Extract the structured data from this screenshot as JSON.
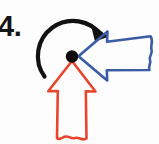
{
  "figure": {
    "problem_label": "4.",
    "canvas": {
      "width": 159,
      "height": 144,
      "background": "#fdfdfd"
    },
    "colors": {
      "label": "#161616",
      "rotation_arc": "#111111",
      "blue_vector": "#3b5ba5",
      "red_vector": "#e8452c",
      "pivot_dot": "#0d0d0d",
      "background": "#fdfdfd"
    },
    "elements": {
      "pivot": {
        "name": "pivot-point",
        "shape": "filled-circle",
        "cx": 72,
        "cy": 56.5,
        "r": 6.2,
        "color": "#0d0d0d"
      },
      "rotation_arc": {
        "name": "counterclockwise-rotation-arc",
        "color": "#111111",
        "stroke_width": 4.2,
        "center_x": 72,
        "center_y": 56.5,
        "radius": 32,
        "start_angle_deg": 190,
        "end_angle_deg": 340,
        "sweep": "clockwise-over-the-top",
        "arrowhead_at": "top-right",
        "arrowhead_tip_x": 104,
        "arrowhead_tip_y": 33,
        "tail_x": 44,
        "tail_y": 75
      },
      "blue_vector": {
        "name": "blue-arrow-pointing-left",
        "color": "#3b5ba5",
        "stroke_width": 2.6,
        "fill": "none",
        "direction": "left",
        "tip_x": 78,
        "tip_y": 56.5,
        "tail_x": 152,
        "tail_edge": "wavy-torn",
        "head_top_y": 31,
        "head_bottom_y": 80,
        "shaft_top_y": 41,
        "shaft_bottom_y": 70
      },
      "red_vector": {
        "name": "red-arrow-pointing-up",
        "color": "#e8452c",
        "stroke_width": 2.6,
        "fill": "none",
        "direction": "up",
        "tip_x": 72,
        "tip_y": 62,
        "tail_y": 140,
        "tail_edge": "wavy-torn",
        "head_left_x": 48,
        "head_right_x": 96,
        "head_base_y": 90,
        "shaft_left_x": 58,
        "shaft_right_x": 86
      }
    }
  }
}
